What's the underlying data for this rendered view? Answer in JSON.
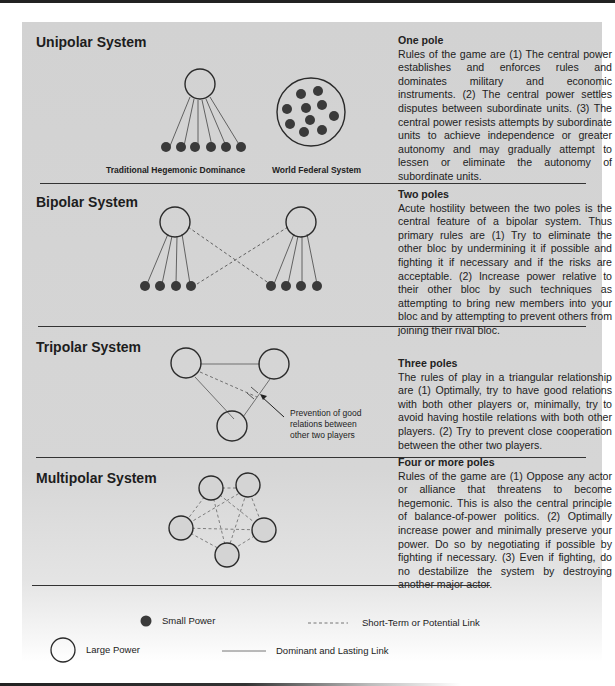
{
  "sections": [
    {
      "title": "Unipolar System",
      "heading": "One pole",
      "body": "Rules of the game are (1) The central power establishes and enforces rules and dominates military and economic instruments. (2) The central power settles disputes between subordinate units. (3) The central power resists attempts by subordinate units to achieve independence or greater autonomy and may gradually attempt to lessen or eliminate the autonomy of subordinate units.",
      "captions": [
        "Traditional Hegemonic Dominance",
        "World Federal System"
      ]
    },
    {
      "title": "Bipolar System",
      "heading": "Two poles",
      "body": "Acute hostility between the two poles is the central feature of a bipolar system. Thus primary rules are (1) Try to eliminate the other bloc by undermining it if possible and fighting it if necessary and if the risks are acceptable. (2) Increase power relative to their other bloc by such techniques as attempting to bring new members into your bloc and by attempting to prevent others from joining their rival bloc."
    },
    {
      "title": "Tripolar System",
      "heading": "Three poles",
      "body": "The rules of play in a triangular relationship are (1) Optimally, try to have good relations with both other players or, minimally, try to avoid having hostile relations with both other players. (2) Try to prevent close cooperation between the other two players.",
      "annotation": "Prevention of good relations between other two players"
    },
    {
      "title": "Multipolar System",
      "heading": "Four or more poles",
      "body": "Rules of the game are (1) Oppose any actor or alliance that threatens to become hegemonic. This is also the central principle of balance-of-power politics. (2) Optimally increase power and minimally preserve your power. Do so by negotiating if possible by fighting if necessary. (3) Even if fighting, do no destabilize the system by destroying another major actor."
    }
  ],
  "legend": {
    "small_power": "Small Power",
    "large_power": "Large Power",
    "short_term_link": "Short-Term or Potential Link",
    "dominant_link": "Dominant and Lasting Link"
  },
  "colors": {
    "panel_bg": "#d4d4d4",
    "ink": "#222222",
    "dot": "#3a3a3a",
    "link": "#555555"
  }
}
